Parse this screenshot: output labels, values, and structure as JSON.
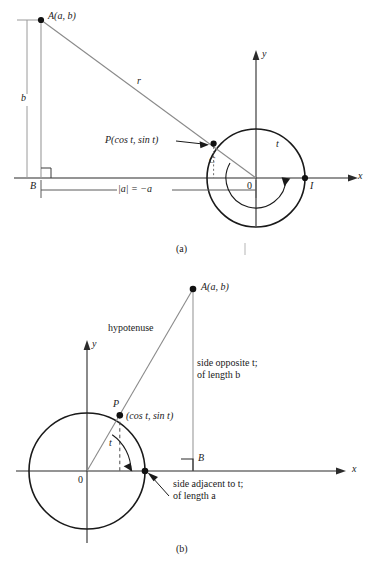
{
  "figure": {
    "panel_a": {
      "caption": "(a)",
      "labels": {
        "point_A": "A(a, b)",
        "height_b": "b",
        "hypotenuse_r": "r",
        "point_P": "P(cos t, sin t)",
        "point_C": "C",
        "point_B": "B",
        "origin": "0",
        "point_I": "I",
        "angle_t": "t",
        "x_axis": "x",
        "y_axis": "y",
        "base_measure": "|a|  =  −a"
      }
    },
    "panel_b": {
      "caption": "(b)",
      "labels": {
        "point_A": "A(a, b)",
        "hypotenuse": "hypotenuse",
        "point_P_name": "P",
        "point_P_coords": "(cos t, sin t)",
        "point_B": "B",
        "origin": "0",
        "angle_t": "t",
        "x_axis": "x",
        "y_axis": "y",
        "side_opposite_line1": "side opposite t;",
        "side_opposite_line2": "of length b",
        "side_adjacent_line1": "side adjacent to t;",
        "side_adjacent_line2": "of length a"
      }
    }
  },
  "colors": {
    "stroke_dark": "#1a1a1a",
    "stroke_light": "#8a8a8a",
    "background": "#ffffff"
  }
}
